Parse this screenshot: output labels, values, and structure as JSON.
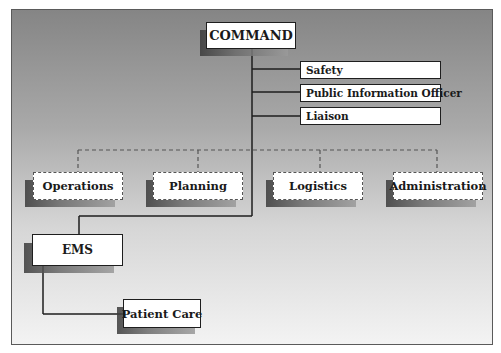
{
  "diagram": {
    "type": "incident-command-org-chart",
    "colors": {
      "background_top": "#858585",
      "background_bottom": "#f3f3f3",
      "box_fill": "#ffffff",
      "line": "#1e1e1e",
      "dashed_line": "#555555"
    },
    "command": {
      "label": "COMMAND"
    },
    "staff": [
      {
        "label": "Safety"
      },
      {
        "label": "Public Information Officer"
      },
      {
        "label": "Liaison"
      }
    ],
    "sections": [
      {
        "label": "Operations"
      },
      {
        "label": "Planning"
      },
      {
        "label": "Logistics"
      },
      {
        "label": "Administration"
      }
    ],
    "ems": {
      "label": "EMS"
    },
    "patient_care": {
      "label": "Patient Care"
    }
  }
}
